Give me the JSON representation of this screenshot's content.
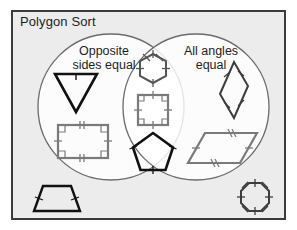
{
  "title": "Polygon Sort",
  "colors": {
    "panel_background": "#ececec",
    "panel_border": "#3b3b3b",
    "circle_stroke": "#6b6b6b",
    "shape_gray": "#7a7a7a",
    "shape_black": "#111111",
    "text": "#1d1d1d",
    "page_background": "#ffffff"
  },
  "venn": {
    "left_circle": {
      "label": "Opposite\nsides equal",
      "cx": 111,
      "cy": 107,
      "r": 73
    },
    "right_circle": {
      "label": "All angles\nequal",
      "cx": 196,
      "cy": 107,
      "r": 73
    }
  },
  "shapes": [
    {
      "name": "triangle",
      "region": "left",
      "label": "inverted triangle",
      "stroke": "#111111",
      "stroke_width": 2.6,
      "tick_marks": 1,
      "right_angle_marks": 0
    },
    {
      "name": "rectangle",
      "region": "left",
      "label": "rectangle",
      "stroke": "#7a7a7a",
      "stroke_width": 2.2,
      "tick_marks": 2,
      "right_angle_marks": 4
    },
    {
      "name": "hexagon",
      "region": "intersection",
      "label": "regular hexagon",
      "stroke": "#555555",
      "stroke_width": 2.0,
      "tick_marks": 1,
      "right_angle_marks": 0
    },
    {
      "name": "square",
      "region": "intersection",
      "label": "square",
      "stroke": "#7a7a7a",
      "stroke_width": 2.2,
      "tick_marks": 1,
      "right_angle_marks": 4
    },
    {
      "name": "pentagon",
      "region": "intersection",
      "label": "regular pentagon",
      "stroke": "#111111",
      "stroke_width": 2.6,
      "tick_marks": 1,
      "right_angle_marks": 0
    },
    {
      "name": "rhombus",
      "region": "right",
      "label": "rhombus",
      "stroke": "#3d3d3d",
      "stroke_width": 2.0,
      "tick_marks": 1,
      "right_angle_marks": 0
    },
    {
      "name": "parallelogram",
      "region": "right",
      "label": "parallelogram",
      "stroke": "#7a7a7a",
      "stroke_width": 2.2,
      "tick_marks": 2,
      "right_angle_marks": 0
    },
    {
      "name": "trapezoid",
      "region": "outside",
      "label": "trapezoid",
      "stroke": "#111111",
      "stroke_width": 2.4,
      "tick_marks": 1,
      "right_angle_marks": 0
    },
    {
      "name": "octagon",
      "region": "outside",
      "label": "regular octagon",
      "stroke": "#3d3d3d",
      "stroke_width": 2.0,
      "tick_marks": 1,
      "right_angle_marks": 0
    }
  ]
}
